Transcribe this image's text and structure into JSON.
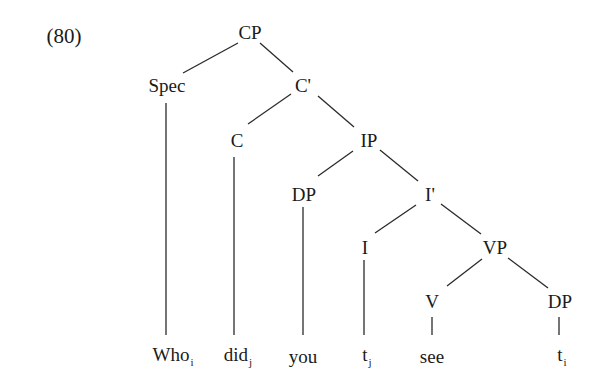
{
  "example_number": "(80)",
  "nodes": {
    "cp": "CP",
    "spec": "Spec",
    "c_bar": "C'",
    "c": "C",
    "ip": "IP",
    "dp_subject": "DP",
    "i_bar": "I'",
    "i": "I",
    "vp": "VP",
    "v": "V",
    "dp_object": "DP"
  },
  "leaves": [
    {
      "word": "Who",
      "index": "i"
    },
    {
      "word": "did",
      "index": "j"
    },
    {
      "word": "you",
      "index": ""
    },
    {
      "word": "t",
      "index": "j"
    },
    {
      "word": "see",
      "index": ""
    },
    {
      "word": "t",
      "index": "i"
    }
  ],
  "colors": {
    "line": "#2a2a2a",
    "text": "#1a1a1a",
    "background": "#ffffff"
  }
}
